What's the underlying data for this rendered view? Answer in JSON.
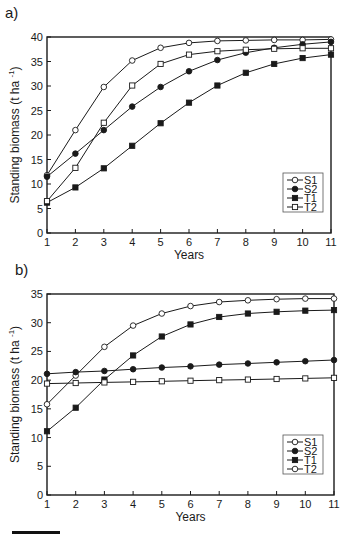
{
  "chart_data": [
    {
      "panel": "a)",
      "type": "line",
      "title": "",
      "xlabel": "Years",
      "ylabel": "Standing biomass (t ha-1)",
      "x": [
        1,
        2,
        3,
        4,
        5,
        6,
        7,
        8,
        9,
        10,
        11
      ],
      "xticks": [
        "1",
        "2",
        "3",
        "4",
        "5",
        "6",
        "7",
        "8",
        "9",
        "10",
        "11"
      ],
      "yticks": [
        "0",
        "5",
        "10",
        "15",
        "20",
        "25",
        "30",
        "35",
        "40"
      ],
      "ylim": [
        0,
        40
      ],
      "grid": false,
      "legend_position": "lower right",
      "series": [
        {
          "name": "S1",
          "marker": "open-circle",
          "values": [
            11.8,
            21.0,
            29.8,
            35.2,
            37.8,
            38.8,
            39.2,
            39.3,
            39.4,
            39.4,
            39.5
          ]
        },
        {
          "name": "S2",
          "marker": "filled-circle",
          "values": [
            11.5,
            16.2,
            21.0,
            25.8,
            29.8,
            33.0,
            35.3,
            36.8,
            37.8,
            38.5,
            39.0
          ]
        },
        {
          "name": "T1",
          "marker": "filled-square",
          "values": [
            6.2,
            9.3,
            13.2,
            17.8,
            22.4,
            26.6,
            30.1,
            32.7,
            34.5,
            35.7,
            36.4
          ]
        },
        {
          "name": "T2",
          "marker": "open-square",
          "values": [
            6.5,
            13.3,
            22.5,
            30.1,
            34.5,
            36.4,
            37.1,
            37.4,
            37.6,
            37.7,
            37.7
          ]
        }
      ]
    },
    {
      "panel": "b)",
      "type": "line",
      "title": "",
      "xlabel": "Years",
      "ylabel": "Standing biomass (t ha-1)",
      "x": [
        1,
        2,
        3,
        4,
        5,
        6,
        7,
        8,
        9,
        10,
        11
      ],
      "xticks": [
        "1",
        "2",
        "3",
        "4",
        "5",
        "6",
        "7",
        "8",
        "9",
        "10",
        "11"
      ],
      "yticks": [
        "0",
        "5",
        "10",
        "15",
        "20",
        "25",
        "30",
        "35"
      ],
      "ylim": [
        0,
        35
      ],
      "grid": false,
      "legend_position": "lower right",
      "series": [
        {
          "name": "S1",
          "marker": "open-circle",
          "values": [
            15.8,
            20.8,
            25.8,
            29.5,
            31.6,
            32.9,
            33.6,
            33.9,
            34.1,
            34.2,
            34.2
          ]
        },
        {
          "name": "S2",
          "marker": "filled-circle",
          "values": [
            21.1,
            21.4,
            21.6,
            21.9,
            22.2,
            22.4,
            22.7,
            22.9,
            23.1,
            23.3,
            23.5
          ]
        },
        {
          "name": "T1",
          "marker": "filled-square",
          "values": [
            11.1,
            15.2,
            20.1,
            24.3,
            27.6,
            29.7,
            31.0,
            31.6,
            31.9,
            32.1,
            32.2
          ]
        },
        {
          "name": "T2",
          "marker": "open-square",
          "legend_marker": "open-circle",
          "values": [
            19.4,
            19.5,
            19.6,
            19.7,
            19.8,
            19.9,
            20.0,
            20.1,
            20.2,
            20.3,
            20.4
          ]
        }
      ]
    }
  ],
  "labels": {
    "panel_a": "a)",
    "panel_b": "b)",
    "ylabel_main": "Standing biomass (t ha",
    "ylabel_sup": "-1",
    "ylabel_close": ")",
    "xlabel": "Years"
  },
  "colors": {
    "ink": "#1a1a1a",
    "background": "#ffffff",
    "legend_border": "#555555"
  }
}
